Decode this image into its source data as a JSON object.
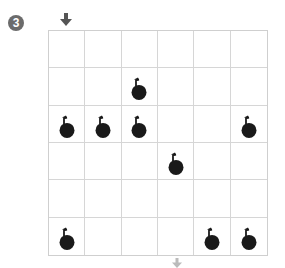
{
  "puzzle": {
    "number_label": "3",
    "rows": 6,
    "cols": 6,
    "entry_arrow": {
      "position": "top",
      "column": 1,
      "icon": "down-arrow-icon",
      "color": "#555555"
    },
    "exit_arrow": {
      "position": "bottom",
      "column": 4,
      "icon": "down-arrow-icon",
      "color": "#bbbbbb"
    },
    "bombs": [
      {
        "row": 2,
        "col": 3
      },
      {
        "row": 3,
        "col": 1
      },
      {
        "row": 3,
        "col": 2
      },
      {
        "row": 3,
        "col": 3
      },
      {
        "row": 3,
        "col": 6
      },
      {
        "row": 4,
        "col": 4
      },
      {
        "row": 6,
        "col": 1
      },
      {
        "row": 6,
        "col": 5
      },
      {
        "row": 6,
        "col": 6
      }
    ],
    "colors": {
      "grid_line": "#d6d6d6",
      "bomb": "#1a1a1a",
      "badge": "#6b6b6b"
    }
  }
}
